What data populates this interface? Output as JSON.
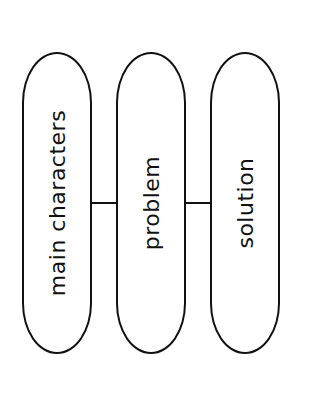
{
  "diagram": {
    "nodes": [
      {
        "label": "main characters"
      },
      {
        "label": "problem"
      },
      {
        "label": "solution"
      }
    ],
    "edges": [
      {
        "from": "main characters",
        "to": "problem"
      },
      {
        "from": "problem",
        "to": "solution"
      }
    ],
    "colors": {
      "stroke": "#111111",
      "background": "#ffffff"
    }
  }
}
